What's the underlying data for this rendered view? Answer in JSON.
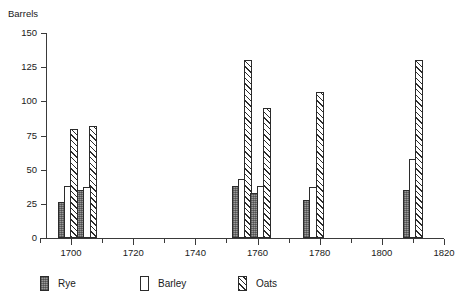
{
  "chart_data": {
    "type": "bar",
    "title": "",
    "subtitle": "",
    "xlabel": "",
    "ylabel": "Barrels",
    "xlim": [
      1690,
      1820
    ],
    "ylim": [
      0,
      150
    ],
    "grid": false,
    "legend_position": "bottom-left",
    "y_ticks": [
      0,
      25,
      50,
      75,
      100,
      125,
      150
    ],
    "y_tick_labels": [
      "0",
      "25",
      "50",
      "75",
      "100",
      "125",
      "150"
    ],
    "x_major_ticks": [
      1700,
      1720,
      1740,
      1760,
      1780,
      1800,
      1820
    ],
    "x_major_tick_labels": [
      "1700",
      "1720",
      "1740",
      "1760",
      "1780",
      "1800",
      "1820"
    ],
    "x_minor_ticks": [
      1690,
      1710,
      1730,
      1750,
      1770,
      1790,
      1810
    ],
    "series": [
      {
        "name": "Rye",
        "color": "#9a9a9a",
        "pattern": "stipple",
        "points": [
          {
            "x": 1697,
            "value": 26
          },
          {
            "x": 1703,
            "value": 35
          },
          {
            "x": 1753,
            "value": 38
          },
          {
            "x": 1759,
            "value": 33
          },
          {
            "x": 1776,
            "value": 28
          },
          {
            "x": 1808,
            "value": 35
          }
        ]
      },
      {
        "name": "Barley",
        "color": "#ffffff",
        "pattern": "solid",
        "points": [
          {
            "x": 1699,
            "value": 38
          },
          {
            "x": 1705,
            "value": 37
          },
          {
            "x": 1755,
            "value": 43
          },
          {
            "x": 1761,
            "value": 38
          },
          {
            "x": 1778,
            "value": 37
          },
          {
            "x": 1810,
            "value": 58
          }
        ]
      },
      {
        "name": "Oats",
        "color": "#ffffff",
        "pattern": "diagonal-hatch",
        "points": [
          {
            "x": 1701,
            "value": 80
          },
          {
            "x": 1707,
            "value": 82
          },
          {
            "x": 1757,
            "value": 130
          },
          {
            "x": 1763,
            "value": 95
          },
          {
            "x": 1780,
            "value": 107
          },
          {
            "x": 1812,
            "value": 130
          }
        ]
      }
    ],
    "bars": [
      {
        "series": "Rye",
        "x": 1697,
        "value": 26
      },
      {
        "series": "Barley",
        "x": 1699,
        "value": 38
      },
      {
        "series": "Rye",
        "x": 1703,
        "value": 35
      },
      {
        "series": "Oats",
        "x": 1701,
        "value": 80
      },
      {
        "series": "Oats",
        "x": 1707,
        "value": 82
      },
      {
        "series": "Barley",
        "x": 1705,
        "value": 37
      },
      {
        "series": "Rye",
        "x": 1753,
        "value": 38
      },
      {
        "series": "Barley",
        "x": 1755,
        "value": 43
      },
      {
        "series": "Oats",
        "x": 1757,
        "value": 130
      },
      {
        "series": "Rye",
        "x": 1759,
        "value": 33
      },
      {
        "series": "Barley",
        "x": 1761,
        "value": 38
      },
      {
        "series": "Oats",
        "x": 1763,
        "value": 95
      },
      {
        "series": "Rye",
        "x": 1776,
        "value": 28
      },
      {
        "series": "Barley",
        "x": 1778,
        "value": 37
      },
      {
        "series": "Oats",
        "x": 1780,
        "value": 107
      },
      {
        "series": "Rye",
        "x": 1808,
        "value": 35
      },
      {
        "series": "Barley",
        "x": 1810,
        "value": 58
      },
      {
        "series": "Oats",
        "x": 1812,
        "value": 130
      }
    ]
  },
  "legend": {
    "items": [
      {
        "label": "Rye",
        "swatch": "rye"
      },
      {
        "label": "Barley",
        "swatch": "barley"
      },
      {
        "label": "Oats",
        "swatch": "oats"
      }
    ]
  }
}
